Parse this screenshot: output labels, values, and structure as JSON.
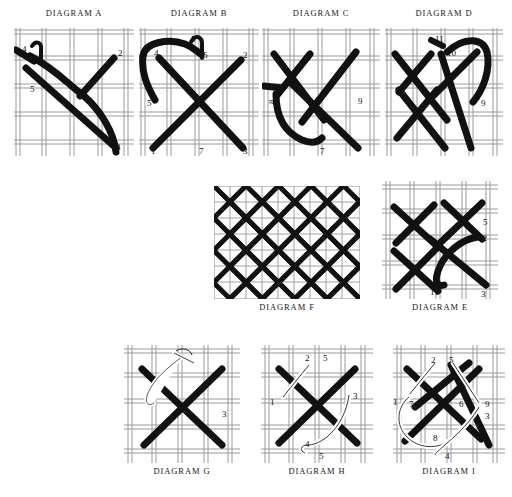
{
  "page": {
    "background_color": "#ffffff",
    "thread_color": "#111111",
    "fabric_line_color": "#8a8a8a",
    "white_thread_color": "#ffffff"
  },
  "diagrams": [
    {
      "id": "a",
      "caption": "DIAGRAM A",
      "caption_position": "top",
      "x": 14,
      "y": 28,
      "w": 120,
      "h": 128,
      "grid_cols": 5,
      "grid_rows": 5,
      "labels": [
        {
          "text": "4",
          "x": 8,
          "y": 24
        },
        {
          "text": "2",
          "x": 104,
          "y": 28
        },
        {
          "text": "5",
          "x": 16,
          "y": 64
        },
        {
          "text": "3",
          "x": 102,
          "y": 122
        },
        {
          "text": "1",
          "x": 14,
          "y": 124
        }
      ]
    },
    {
      "id": "b",
      "caption": "DIAGRAM B",
      "caption_position": "top",
      "x": 139,
      "y": 28,
      "w": 120,
      "h": 128,
      "grid_cols": 5,
      "grid_rows": 5,
      "labels": [
        {
          "text": "4",
          "x": 15,
          "y": 25
        },
        {
          "text": "5",
          "x": 55,
          "y": 14
        },
        {
          "text": "6",
          "x": 64,
          "y": 28
        },
        {
          "text": "2",
          "x": 104,
          "y": 27
        },
        {
          "text": "5",
          "x": 8,
          "y": 74
        },
        {
          "text": "1",
          "x": 12,
          "y": 124
        },
        {
          "text": "7",
          "x": 60,
          "y": 124
        },
        {
          "text": "3",
          "x": 104,
          "y": 124
        }
      ]
    },
    {
      "id": "c",
      "caption": "DIAGRAM C",
      "caption_position": "top",
      "x": 262,
      "y": 28,
      "w": 118,
      "h": 128,
      "grid_cols": 5,
      "grid_rows": 5,
      "labels": [
        {
          "text": "8",
          "x": 13,
          "y": 72
        },
        {
          "text": "9",
          "x": 96,
          "y": 72
        },
        {
          "text": "7",
          "x": 58,
          "y": 124
        }
      ]
    },
    {
      "id": "d",
      "caption": "DIAGRAM D",
      "caption_position": "top",
      "x": 385,
      "y": 28,
      "w": 118,
      "h": 128,
      "grid_cols": 5,
      "grid_rows": 5,
      "labels": [
        {
          "text": "11",
          "x": 50,
          "y": 14
        },
        {
          "text": "10",
          "x": 62,
          "y": 26
        },
        {
          "text": "9",
          "x": 96,
          "y": 76
        }
      ]
    },
    {
      "id": "f",
      "caption": "DIAGRAM F",
      "caption_position": "bottom",
      "x": 214,
      "y": 186,
      "w": 146,
      "h": 113,
      "grid_cols": 9,
      "grid_rows": 7,
      "labels": []
    },
    {
      "id": "e",
      "caption": "DIAGRAM E",
      "caption_position": "bottom",
      "x": 382,
      "y": 181,
      "w": 116,
      "h": 118,
      "grid_cols": 5,
      "grid_rows": 5,
      "labels": [
        {
          "text": "5",
          "x": 101,
          "y": 40
        },
        {
          "text": "12",
          "x": 98,
          "y": 56
        },
        {
          "text": "11",
          "x": 48,
          "y": 110
        },
        {
          "text": "3",
          "x": 99,
          "y": 112
        }
      ]
    },
    {
      "id": "g",
      "caption": "DIAGRAM G",
      "caption_position": "bottom",
      "x": 124,
      "y": 345,
      "w": 116,
      "h": 118,
      "grid_cols": 5,
      "grid_rows": 5,
      "labels": [
        {
          "text": "3",
          "x": 98,
          "y": 68
        }
      ]
    },
    {
      "id": "h",
      "caption": "DIAGRAM H",
      "caption_position": "bottom",
      "x": 261,
      "y": 345,
      "w": 112,
      "h": 118,
      "grid_cols": 5,
      "grid_rows": 5,
      "labels": [
        {
          "text": "2",
          "x": 44,
          "y": 14
        },
        {
          "text": "5",
          "x": 62,
          "y": 14
        },
        {
          "text": "1",
          "x": 9,
          "y": 56
        },
        {
          "text": "3",
          "x": 92,
          "y": 52
        },
        {
          "text": "4",
          "x": 44,
          "y": 99
        },
        {
          "text": "5",
          "x": 58,
          "y": 110
        }
      ]
    },
    {
      "id": "i",
      "caption": "DIAGRAM I",
      "caption_position": "bottom",
      "x": 393,
      "y": 345,
      "w": 112,
      "h": 118,
      "grid_cols": 5,
      "grid_rows": 5,
      "labels": [
        {
          "text": "2",
          "x": 38,
          "y": 15
        },
        {
          "text": "5",
          "x": 56,
          "y": 15
        },
        {
          "text": "1",
          "x": 2,
          "y": 56
        },
        {
          "text": "7",
          "x": 16,
          "y": 58
        },
        {
          "text": "6",
          "x": 66,
          "y": 58
        },
        {
          "text": "9",
          "x": 92,
          "y": 58
        },
        {
          "text": "3",
          "x": 92,
          "y": 70
        },
        {
          "text": "8",
          "x": 40,
          "y": 92
        },
        {
          "text": "4",
          "x": 52,
          "y": 110
        }
      ]
    }
  ]
}
